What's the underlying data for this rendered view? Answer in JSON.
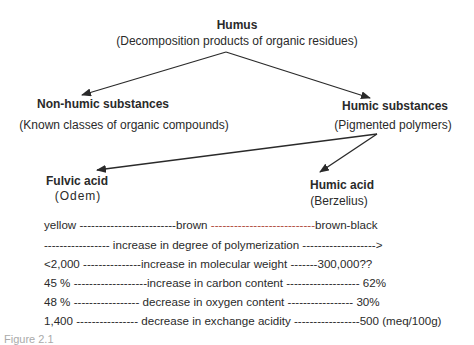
{
  "nodes": {
    "humus": {
      "title": "Humus",
      "subtitle": "(Decomposition products of organic residues)"
    },
    "non_humic": {
      "title": "Non-humic substances",
      "subtitle": "(Known classes of organic compounds)"
    },
    "humic_substances": {
      "title": "Humic substances",
      "subtitle": "(Pigmented polymers)"
    },
    "fulvic_acid": {
      "title": "Fulvic acid",
      "subtitle": "(Odem)"
    },
    "humic_acid": {
      "title": "Humic acid",
      "subtitle": "(Berzelius)"
    }
  },
  "edges": [
    {
      "from": "humus",
      "to": "non_humic"
    },
    {
      "from": "humus",
      "to": "humic_substances"
    },
    {
      "from": "humic_substances",
      "to": "fulvic_acid"
    },
    {
      "from": "humic_substances",
      "to": "humic_acid"
    }
  ],
  "gradients": [
    {
      "left": "yellow",
      "dash1": "-------------------------",
      "middle": "brown",
      "dash2": "---------------------------",
      "right": "brown-black"
    },
    {
      "left": "",
      "dash1": "----------------- ",
      "middle": "increase in degree of polymerization",
      "dash2": " ------------------->",
      "right": ""
    },
    {
      "left": "<2,000",
      "dash1": " ---------------",
      "middle": "increase in molecular weight",
      "dash2": " -------",
      "right": "300,000??"
    },
    {
      "left": "45 %",
      "dash1": " -------------------",
      "middle": "increase in carbon content",
      "dash2": " ------------------- ",
      "right": "62%"
    },
    {
      "left": "48 %",
      "dash1": " ----------------- ",
      "middle": "decrease in oxygen content",
      "dash2": " ----------------- ",
      "right": "30%"
    },
    {
      "left": "1,400",
      "dash1": " ---------------- ",
      "middle": "decrease in exchange acidity",
      "dash2": " -----------------",
      "right": "500  (meq/100g)"
    }
  ],
  "caption": "Figure 2.1"
}
